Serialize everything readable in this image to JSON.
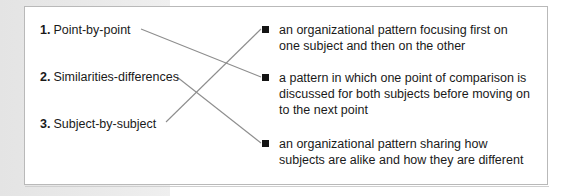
{
  "exercise": {
    "type": "matching-exercise",
    "left_column": [
      {
        "number": "1.",
        "label": "Point-by-point"
      },
      {
        "number": "2.",
        "label": "Similarities-differences"
      },
      {
        "number": "3.",
        "label": "Subject-by-subject"
      }
    ],
    "right_column": [
      {
        "bullet": "square-bullet-icon",
        "text": "an organizational pattern focusing first on one subject and then on the other"
      },
      {
        "bullet": "square-bullet-icon",
        "text": "a pattern in which one point of comparison is discussed for both subjects before moving on to the next point"
      },
      {
        "bullet": "square-bullet-icon",
        "text": "an organizational pattern sharing how subjects are alike and how they are different"
      }
    ],
    "connections": [
      {
        "from": "1",
        "to": "b"
      },
      {
        "from": "2",
        "to": "c"
      },
      {
        "from": "3",
        "to": "a"
      }
    ]
  },
  "style": {
    "card_background": "#ffffff",
    "card_border": "#b9b9b9",
    "page_background": "#e9e9e9",
    "text_color": "#1a1a1a",
    "bullet_color": "#141414",
    "connector_color": "#8d8d8d"
  }
}
